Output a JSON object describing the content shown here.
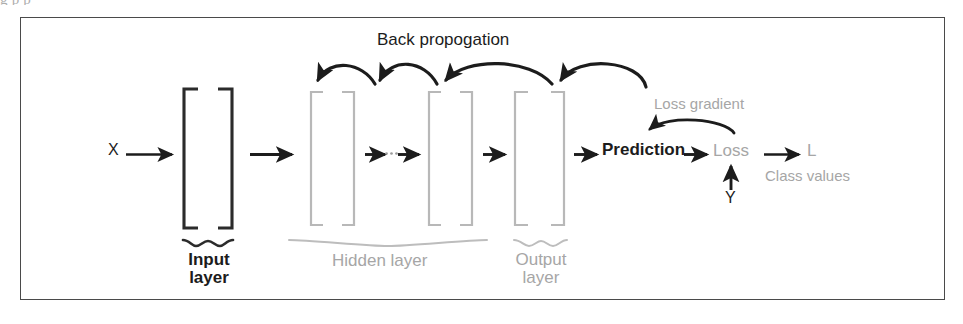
{
  "figure": {
    "type": "neural-network-backpropagation-diagram",
    "frame": {
      "border_color": "#4a4a4a"
    },
    "caption_remnant": "g              p                 p"
  },
  "colors": {
    "dark": "#1c1c1c",
    "gray": "#a6a6a6",
    "mid_gray": "#9a9a9a",
    "frame": "#4a4a4a",
    "background": "#ffffff"
  },
  "labels": {
    "back_propagation": "Back propogation",
    "input_layer": "Input\nlayer",
    "input_layer_line1": "Input",
    "input_layer_line2": "layer",
    "hidden_layer": "Hidden layer",
    "output_layer_line1": "Output",
    "output_layer_line2": "layer",
    "input_x": "X",
    "prediction": "Prediction",
    "loss": "Loss",
    "loss_output": "L",
    "loss_gradient": "Loss gradient",
    "class_values": "Class values",
    "target_y": "Y"
  },
  "layers": [
    {
      "name": "input-layer",
      "label": "Input layer",
      "color": "dark",
      "x": 183,
      "width": 50
    },
    {
      "name": "hidden-layer-first",
      "label": "Hidden layer",
      "color": "gray",
      "x": 310,
      "width": 46
    },
    {
      "name": "hidden-layer-last",
      "label": "Hidden layer",
      "color": "gray",
      "x": 428,
      "width": 46
    },
    {
      "name": "output-layer",
      "label": "Output layer",
      "color": "gray",
      "x": 514,
      "width": 52
    }
  ],
  "forward_arrows": [
    {
      "name": "arrow-x-to-input",
      "from": "X",
      "to": "input-layer"
    },
    {
      "name": "arrow-input-to-hidden",
      "from": "input-layer",
      "to": "hidden-layer-first"
    },
    {
      "name": "arrow-hidden-chain-left",
      "from": "hidden-layer-first",
      "to": "ellipsis"
    },
    {
      "name": "arrow-hidden-chain-right",
      "from": "ellipsis",
      "to": "hidden-layer-last"
    },
    {
      "name": "arrow-hidden-to-output",
      "from": "hidden-layer-last",
      "to": "output-layer"
    },
    {
      "name": "arrow-output-to-prediction",
      "from": "output-layer",
      "to": "Prediction"
    },
    {
      "name": "arrow-prediction-to-loss",
      "from": "Prediction",
      "to": "Loss"
    },
    {
      "name": "arrow-loss-to-l",
      "from": "Loss",
      "to": "L"
    },
    {
      "name": "arrow-y-to-loss",
      "from": "Y",
      "to": "Loss"
    }
  ],
  "backprop_arrows": [
    {
      "name": "backprop-arc-1",
      "direction": "right-to-left"
    },
    {
      "name": "backprop-arc-2",
      "direction": "right-to-left"
    },
    {
      "name": "backprop-arc-3",
      "direction": "right-to-left"
    },
    {
      "name": "backprop-arc-4",
      "direction": "right-to-left"
    }
  ],
  "loss_gradient_arrow": {
    "name": "loss-gradient-arc",
    "from": "Loss",
    "to": "Prediction"
  },
  "ellipsis": "···"
}
